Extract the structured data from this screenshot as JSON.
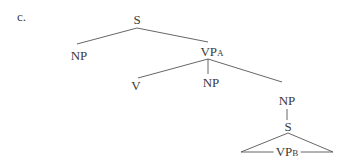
{
  "example_label": "c.",
  "tree": {
    "root": {
      "label": "S"
    },
    "np_subject": {
      "label": "NP"
    },
    "vp_a": {
      "label": "VP",
      "subscript": "A"
    },
    "verb": {
      "label": "V"
    },
    "np_object": {
      "label": "NP"
    },
    "np_complex": {
      "label": "NP"
    },
    "s_embedded": {
      "label": "S"
    },
    "vp_b": {
      "label": "VP",
      "subscript": "B"
    }
  },
  "colors": {
    "line": "#555555",
    "text": "#3a3a3a"
  }
}
